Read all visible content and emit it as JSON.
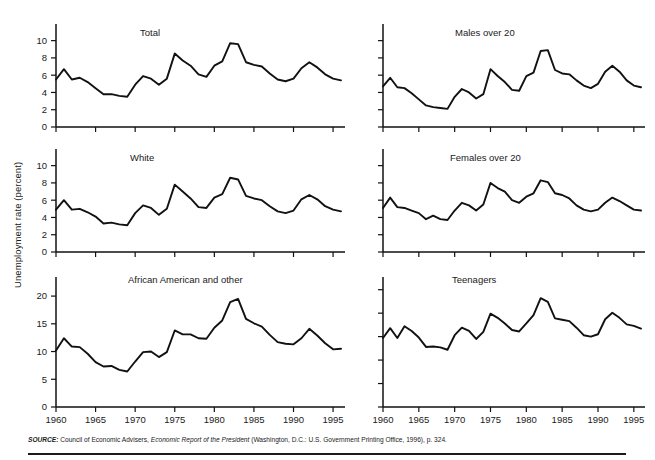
{
  "figure": {
    "y_axis_label": "Unemployment rate (percent)",
    "source_prefix": "SOURCE:",
    "source_part1": " Council of Economic Advisers, ",
    "source_italic": "Economic Report of the President",
    "source_part2": " (Washington, D.C.: U.S. Government Printing Office, 1996), p. 324."
  },
  "colors": {
    "line": "#111111",
    "axis": "#111111",
    "text": "#1a1a1a",
    "background": "#ffffff"
  },
  "chart_data": [
    {
      "type": "line",
      "title": "Total",
      "xlabel": "",
      "ylabel": "Unemployment rate (percent)",
      "xlim": [
        1960,
        1996
      ],
      "ylim": [
        0,
        11
      ],
      "yticks": [
        0,
        2,
        4,
        6,
        8,
        10
      ],
      "ytick_labels": [
        "0",
        "2",
        "4",
        "6",
        "8",
        "10"
      ],
      "xticks": [
        1960,
        1965,
        1970,
        1975,
        1980,
        1985,
        1990,
        1995
      ],
      "xtick_labels": [
        "1960",
        "1965",
        "1970",
        "1975",
        "1980",
        "1985",
        "1990",
        "1995"
      ],
      "grid": false,
      "legend": "none",
      "x": [
        1960,
        1961,
        1962,
        1963,
        1964,
        1965,
        1966,
        1967,
        1968,
        1969,
        1970,
        1971,
        1972,
        1973,
        1974,
        1975,
        1976,
        1977,
        1978,
        1979,
        1980,
        1981,
        1982,
        1983,
        1984,
        1985,
        1986,
        1987,
        1988,
        1989,
        1990,
        1991,
        1992,
        1993,
        1994,
        1995,
        1996
      ],
      "values": [
        5.5,
        6.7,
        5.5,
        5.7,
        5.2,
        4.5,
        3.8,
        3.8,
        3.6,
        3.5,
        4.9,
        5.9,
        5.6,
        4.9,
        5.6,
        8.5,
        7.7,
        7.1,
        6.1,
        5.8,
        7.1,
        7.6,
        9.7,
        9.6,
        7.5,
        7.2,
        7.0,
        6.2,
        5.5,
        5.3,
        5.6,
        6.8,
        7.5,
        6.9,
        6.1,
        5.6,
        5.4
      ]
    },
    {
      "type": "line",
      "title": "Males over 20",
      "xlabel": "",
      "ylabel": "",
      "xlim": [
        1960,
        1996
      ],
      "ylim": [
        0,
        11
      ],
      "yticks": [
        0,
        2,
        4,
        6,
        8,
        10
      ],
      "ytick_labels": [
        "",
        "",
        "",
        "",
        "",
        ""
      ],
      "xticks": [
        1960,
        1965,
        1970,
        1975,
        1980,
        1985,
        1990,
        1995
      ],
      "xtick_labels": [
        "1960",
        "1965",
        "1970",
        "1975",
        "1980",
        "1985",
        "1990",
        "1995"
      ],
      "grid": false,
      "legend": "none",
      "x": [
        1960,
        1961,
        1962,
        1963,
        1964,
        1965,
        1966,
        1967,
        1968,
        1969,
        1970,
        1971,
        1972,
        1973,
        1974,
        1975,
        1976,
        1977,
        1978,
        1979,
        1980,
        1981,
        1982,
        1983,
        1984,
        1985,
        1986,
        1987,
        1988,
        1989,
        1990,
        1991,
        1992,
        1993,
        1994,
        1995,
        1996
      ],
      "values": [
        4.7,
        5.7,
        4.6,
        4.5,
        3.9,
        3.2,
        2.5,
        2.3,
        2.2,
        2.1,
        3.5,
        4.4,
        4.0,
        3.3,
        3.8,
        6.7,
        5.9,
        5.2,
        4.3,
        4.2,
        5.9,
        6.3,
        8.8,
        8.9,
        6.6,
        6.2,
        6.1,
        5.4,
        4.8,
        4.5,
        5.0,
        6.4,
        7.1,
        6.4,
        5.4,
        4.8,
        4.6
      ]
    },
    {
      "type": "line",
      "title": "White",
      "xlabel": "",
      "ylabel": "",
      "xlim": [
        1960,
        1996
      ],
      "ylim": [
        0,
        11
      ],
      "yticks": [
        0,
        2,
        4,
        6,
        8,
        10
      ],
      "ytick_labels": [
        "0",
        "2",
        "4",
        "6",
        "8",
        "10"
      ],
      "xticks": [
        1960,
        1965,
        1970,
        1975,
        1980,
        1985,
        1990,
        1995
      ],
      "xtick_labels": [
        "1960",
        "1965",
        "1970",
        "1975",
        "1980",
        "1985",
        "1990",
        "1995"
      ],
      "grid": false,
      "legend": "none",
      "x": [
        1960,
        1961,
        1962,
        1963,
        1964,
        1965,
        1966,
        1967,
        1968,
        1969,
        1970,
        1971,
        1972,
        1973,
        1974,
        1975,
        1976,
        1977,
        1978,
        1979,
        1980,
        1981,
        1982,
        1983,
        1984,
        1985,
        1986,
        1987,
        1988,
        1989,
        1990,
        1991,
        1992,
        1993,
        1994,
        1995,
        1996
      ],
      "values": [
        4.9,
        6.0,
        4.9,
        5.0,
        4.6,
        4.1,
        3.3,
        3.4,
        3.2,
        3.1,
        4.5,
        5.4,
        5.1,
        4.3,
        5.0,
        7.8,
        7.0,
        6.2,
        5.2,
        5.1,
        6.3,
        6.7,
        8.6,
        8.4,
        6.5,
        6.2,
        6.0,
        5.3,
        4.7,
        4.5,
        4.8,
        6.1,
        6.6,
        6.1,
        5.3,
        4.9,
        4.7
      ]
    },
    {
      "type": "line",
      "title": "Females over 20",
      "xlabel": "",
      "ylabel": "",
      "xlim": [
        1960,
        1996
      ],
      "ylim": [
        0,
        11
      ],
      "yticks": [
        0,
        2,
        4,
        6,
        8,
        10
      ],
      "ytick_labels": [
        "",
        "",
        "",
        "",
        "",
        ""
      ],
      "xticks": [
        1960,
        1965,
        1970,
        1975,
        1980,
        1985,
        1990,
        1995
      ],
      "xtick_labels": [
        "1960",
        "1965",
        "1970",
        "1975",
        "1980",
        "1985",
        "1990",
        "1995"
      ],
      "grid": false,
      "legend": "none",
      "x": [
        1960,
        1961,
        1962,
        1963,
        1964,
        1965,
        1966,
        1967,
        1968,
        1969,
        1970,
        1971,
        1972,
        1973,
        1974,
        1975,
        1976,
        1977,
        1978,
        1979,
        1980,
        1981,
        1982,
        1983,
        1984,
        1985,
        1986,
        1987,
        1988,
        1989,
        1990,
        1991,
        1992,
        1993,
        1994,
        1995,
        1996
      ],
      "values": [
        5.1,
        6.3,
        5.2,
        5.1,
        4.8,
        4.5,
        3.8,
        4.2,
        3.8,
        3.7,
        4.8,
        5.7,
        5.4,
        4.8,
        5.5,
        8.0,
        7.4,
        7.0,
        6.0,
        5.7,
        6.4,
        6.8,
        8.3,
        8.1,
        6.8,
        6.6,
        6.2,
        5.4,
        4.9,
        4.7,
        4.9,
        5.7,
        6.3,
        5.9,
        5.4,
        4.9,
        4.8
      ]
    },
    {
      "type": "line",
      "title": "African American and other",
      "xlabel": "",
      "ylabel": "",
      "xlim": [
        1960,
        1996
      ],
      "ylim": [
        0,
        22
      ],
      "yticks": [
        0,
        5,
        10,
        15,
        20
      ],
      "ytick_labels": [
        "0",
        "5",
        "10",
        "15",
        "20"
      ],
      "xticks": [
        1960,
        1965,
        1970,
        1975,
        1980,
        1985,
        1990,
        1995
      ],
      "xtick_labels": [
        "1960",
        "1965",
        "1970",
        "1975",
        "1980",
        "1985",
        "1990",
        "1995"
      ],
      "grid": false,
      "legend": "none",
      "x": [
        1960,
        1961,
        1962,
        1963,
        1964,
        1965,
        1966,
        1967,
        1968,
        1969,
        1970,
        1971,
        1972,
        1973,
        1974,
        1975,
        1976,
        1977,
        1978,
        1979,
        1980,
        1981,
        1982,
        1983,
        1984,
        1985,
        1986,
        1987,
        1988,
        1989,
        1990,
        1991,
        1992,
        1993,
        1994,
        1995,
        1996
      ],
      "values": [
        10.2,
        12.4,
        10.9,
        10.8,
        9.6,
        8.1,
        7.3,
        7.4,
        6.7,
        6.4,
        8.2,
        9.9,
        10.0,
        9.0,
        9.9,
        13.8,
        13.1,
        13.1,
        12.4,
        12.3,
        14.3,
        15.6,
        18.9,
        19.5,
        15.9,
        15.1,
        14.5,
        13.0,
        11.7,
        11.4,
        11.3,
        12.4,
        14.1,
        12.9,
        11.5,
        10.4,
        10.5
      ]
    },
    {
      "type": "line",
      "title": "Teenagers",
      "xlabel": "",
      "ylabel": "",
      "xlim": [
        1960,
        1996
      ],
      "ylim": [
        0,
        26
      ],
      "yticks": [
        0,
        5,
        10,
        15,
        20,
        25
      ],
      "ytick_labels": [
        "",
        "",
        "",
        "",
        "",
        ""
      ],
      "xticks": [
        1960,
        1965,
        1970,
        1975,
        1980,
        1985,
        1990,
        1995
      ],
      "xtick_labels": [
        "1960",
        "1965",
        "1970",
        "1975",
        "1980",
        "1985",
        "1990",
        "1995"
      ],
      "grid": false,
      "legend": "none",
      "x": [
        1960,
        1961,
        1962,
        1963,
        1964,
        1965,
        1966,
        1967,
        1968,
        1969,
        1970,
        1971,
        1972,
        1973,
        1974,
        1975,
        1976,
        1977,
        1978,
        1979,
        1980,
        1981,
        1982,
        1983,
        1984,
        1985,
        1986,
        1987,
        1988,
        1989,
        1990,
        1991,
        1992,
        1993,
        1994,
        1995,
        1996
      ],
      "values": [
        14.7,
        16.8,
        14.7,
        17.2,
        16.2,
        14.8,
        12.8,
        12.9,
        12.7,
        12.2,
        15.3,
        16.9,
        16.2,
        14.5,
        16.0,
        19.9,
        19.0,
        17.8,
        16.4,
        16.1,
        17.8,
        19.6,
        23.2,
        22.4,
        18.9,
        18.6,
        18.3,
        16.9,
        15.3,
        15.0,
        15.5,
        18.7,
        20.1,
        19.0,
        17.6,
        17.3,
        16.7
      ]
    }
  ]
}
